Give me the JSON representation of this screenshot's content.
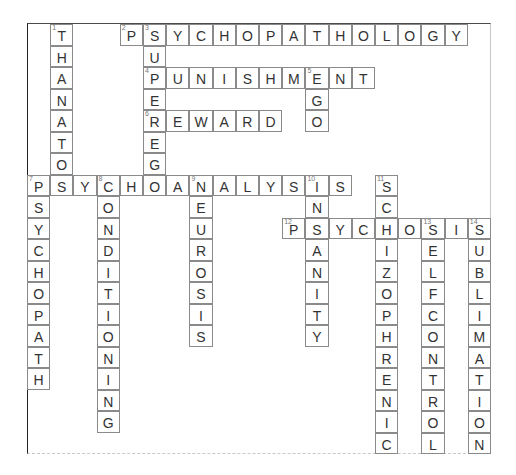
{
  "puzzle": {
    "grid": {
      "origin_x": 27,
      "origin_y": 24,
      "cell_w": 23.2,
      "cell_h": 21.5,
      "cols": 20,
      "rows": 20
    },
    "colors": {
      "background": "#ffffff",
      "cell_border": "#8a8a8a",
      "letter": "#333333",
      "number": "#777777"
    },
    "words": [
      {
        "number": "1",
        "answer": "THANATOS",
        "direction": "down",
        "row": 0,
        "col": 1
      },
      {
        "number": "2",
        "answer": "PSYCHOPATHOLOGY",
        "direction": "across",
        "row": 0,
        "col": 4
      },
      {
        "number": "3",
        "answer": "SUPEREGO",
        "direction": "down",
        "row": 0,
        "col": 5
      },
      {
        "number": "4",
        "answer": "PUNISHMENT",
        "direction": "across",
        "row": 2,
        "col": 5
      },
      {
        "number": "5",
        "answer": "EGO",
        "direction": "down",
        "row": 2,
        "col": 12
      },
      {
        "number": "6",
        "answer": "REWARD",
        "direction": "across",
        "row": 4,
        "col": 5
      },
      {
        "number": "7",
        "answer": "PSYCHOANALYSIS",
        "direction": "across",
        "row": 7,
        "col": 0
      },
      {
        "number": "7",
        "answer": "PSYCHOPATH",
        "direction": "down",
        "row": 7,
        "col": 0
      },
      {
        "number": "8",
        "answer": "CONDITIONING",
        "direction": "down",
        "row": 7,
        "col": 3
      },
      {
        "number": "9",
        "answer": "NEUROSIS",
        "direction": "down",
        "row": 7,
        "col": 7
      },
      {
        "number": "10",
        "answer": "INSANITY",
        "direction": "down",
        "row": 7,
        "col": 12
      },
      {
        "number": "11",
        "answer": "SCHIZOPHRENIC",
        "direction": "down",
        "row": 7,
        "col": 15
      },
      {
        "number": "12",
        "answer": "PSYCHOSIS",
        "direction": "across",
        "row": 9,
        "col": 11
      },
      {
        "number": "13",
        "answer": "SELFCONTROL",
        "direction": "down",
        "row": 9,
        "col": 17
      },
      {
        "number": "14",
        "answer": "SUBLIMATION",
        "direction": "down",
        "row": 9,
        "col": 19
      }
    ]
  }
}
